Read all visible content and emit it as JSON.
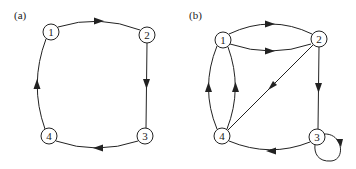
{
  "panels": [
    {
      "label": "(a)",
      "nodes": [
        {
          "id": "1",
          "label": "1",
          "x": 51,
          "y": 32
        },
        {
          "id": "2",
          "label": "2",
          "x": 147,
          "y": 35
        },
        {
          "id": "3",
          "label": "3",
          "x": 145,
          "y": 136
        },
        {
          "id": "4",
          "label": "4",
          "x": 49,
          "y": 136
        }
      ],
      "edges": [
        {
          "from": "1",
          "to": "2",
          "shape": "arc-up"
        },
        {
          "from": "2",
          "to": "3",
          "shape": "straight"
        },
        {
          "from": "3",
          "to": "4",
          "shape": "arc-down"
        },
        {
          "from": "4",
          "to": "1",
          "shape": "arc-left"
        }
      ]
    },
    {
      "label": "(b)",
      "nodes": [
        {
          "id": "1",
          "label": "1",
          "x": 223,
          "y": 40
        },
        {
          "id": "2",
          "label": "2",
          "x": 319,
          "y": 39
        },
        {
          "id": "3",
          "label": "3",
          "x": 317,
          "y": 137
        },
        {
          "id": "4",
          "label": "4",
          "x": 222,
          "y": 136
        }
      ],
      "edges": [
        {
          "from": "1",
          "to": "2",
          "shape": "arc-up"
        },
        {
          "from": "1",
          "to": "2",
          "shape": "arc-down"
        },
        {
          "from": "2",
          "to": "3",
          "shape": "straight"
        },
        {
          "from": "2",
          "to": "4",
          "shape": "straight-diagonal"
        },
        {
          "from": "3",
          "to": "4",
          "shape": "arc-down"
        },
        {
          "from": "3",
          "to": "3",
          "shape": "self-loop"
        },
        {
          "from": "4",
          "to": "1",
          "shape": "arc-left"
        },
        {
          "from": "4",
          "to": "1",
          "shape": "arc-right"
        }
      ]
    }
  ]
}
